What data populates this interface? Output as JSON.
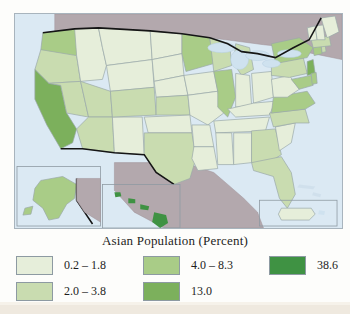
{
  "map": {
    "title_in_legend": "Asian Population (Percent)",
    "colors": {
      "ocean": "#dbe9f3",
      "lake": "#cfe2ef",
      "foreign_land": "#b3a8ad",
      "border_national": "#1a1a1a",
      "border_state": "#9aa8a8",
      "frame": "#a8b4bd",
      "class1": "#e6eeda",
      "class2": "#c9dcb0",
      "class3": "#a9cc87",
      "class4": "#7cb05c",
      "class5": "#3f9243"
    },
    "insets": [
      {
        "name": "alaska-inset"
      },
      {
        "name": "hawaii-inset"
      },
      {
        "name": "puerto-rico-inset"
      }
    ],
    "states": [
      {
        "id": "WA",
        "class": 3
      },
      {
        "id": "OR",
        "class": 2
      },
      {
        "id": "CA",
        "class": 4
      },
      {
        "id": "NV",
        "class": 2
      },
      {
        "id": "ID",
        "class": 1
      },
      {
        "id": "MT",
        "class": 1
      },
      {
        "id": "WY",
        "class": 1
      },
      {
        "id": "UT",
        "class": 2
      },
      {
        "id": "AZ",
        "class": 2
      },
      {
        "id": "NM",
        "class": 1
      },
      {
        "id": "CO",
        "class": 2
      },
      {
        "id": "ND",
        "class": 1
      },
      {
        "id": "SD",
        "class": 1
      },
      {
        "id": "NE",
        "class": 1
      },
      {
        "id": "KS",
        "class": 2
      },
      {
        "id": "OK",
        "class": 1
      },
      {
        "id": "TX",
        "class": 2
      },
      {
        "id": "MN",
        "class": 3
      },
      {
        "id": "IA",
        "class": 1
      },
      {
        "id": "MO",
        "class": 1
      },
      {
        "id": "AR",
        "class": 1
      },
      {
        "id": "LA",
        "class": 1
      },
      {
        "id": "WI",
        "class": 2
      },
      {
        "id": "IL",
        "class": 3
      },
      {
        "id": "MI",
        "class": 2
      },
      {
        "id": "IN",
        "class": 1
      },
      {
        "id": "OH",
        "class": 1
      },
      {
        "id": "KY",
        "class": 1
      },
      {
        "id": "TN",
        "class": 1
      },
      {
        "id": "MS",
        "class": 1
      },
      {
        "id": "AL",
        "class": 1
      },
      {
        "id": "GA",
        "class": 2
      },
      {
        "id": "FL",
        "class": 2
      },
      {
        "id": "SC",
        "class": 1
      },
      {
        "id": "NC",
        "class": 2
      },
      {
        "id": "VA",
        "class": 3
      },
      {
        "id": "WV",
        "class": 1
      },
      {
        "id": "PA",
        "class": 2
      },
      {
        "id": "NY",
        "class": 3
      },
      {
        "id": "NJ",
        "class": 4
      },
      {
        "id": "MD",
        "class": 3
      },
      {
        "id": "DE",
        "class": 3
      },
      {
        "id": "CT",
        "class": 3
      },
      {
        "id": "RI",
        "class": 2
      },
      {
        "id": "MA",
        "class": 2
      },
      {
        "id": "VT",
        "class": 1
      },
      {
        "id": "NH",
        "class": 1
      },
      {
        "id": "ME",
        "class": 1
      },
      {
        "id": "AK",
        "class": 3
      },
      {
        "id": "HI",
        "class": 5
      },
      {
        "id": "PR",
        "class": 1
      }
    ]
  },
  "legend": {
    "title": "Asian Population (Percent)",
    "columns": [
      {
        "items": [
          {
            "label": "0.2 – 1.8",
            "color": "#e6eeda"
          },
          {
            "label": "2.0 – 3.8",
            "color": "#c9dcb0"
          }
        ]
      },
      {
        "items": [
          {
            "label": "4.0 – 8.3",
            "color": "#a9cc87"
          },
          {
            "label": "13.0",
            "color": "#7cb05c"
          }
        ]
      },
      {
        "items": [
          {
            "label": "38.6",
            "color": "#3f9243"
          }
        ]
      }
    ]
  }
}
